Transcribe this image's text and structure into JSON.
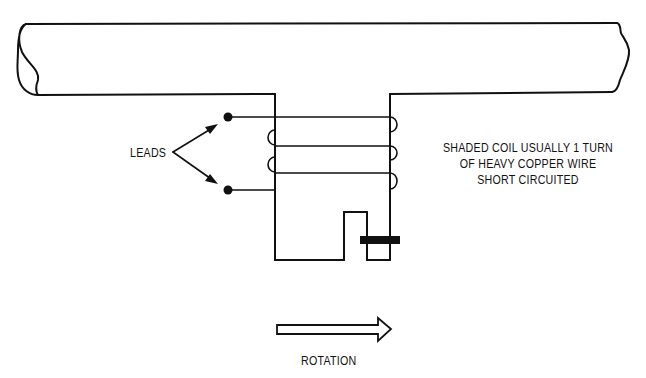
{
  "diagram": {
    "type": "shaded-pole motor schematic",
    "colors": {
      "line": "#111111",
      "background": "#ffffff"
    },
    "labels": {
      "leads": "LEADS",
      "shaded_coil_line1": "SHADED COIL USUALLY 1 TURN",
      "shaded_coil_line2": "OF HEAVY COPPER WIRE",
      "shaded_coil_line3": "SHORT CIRCUITED",
      "rotation": "ROTATION"
    },
    "components": [
      {
        "id": "stator-yoke",
        "shape": "horizontal bar with broken ends"
      },
      {
        "id": "pole-piece",
        "shape": "T-pole extending down from yoke"
      },
      {
        "id": "field-winding",
        "turns_visible": 3
      },
      {
        "id": "lead-terminals",
        "count": 2
      },
      {
        "id": "shading-slot",
        "shape": "notch in pole face"
      },
      {
        "id": "shading-coil",
        "shape": "solid bar across slot"
      },
      {
        "id": "rotation-arrow",
        "direction": "right"
      }
    ]
  }
}
